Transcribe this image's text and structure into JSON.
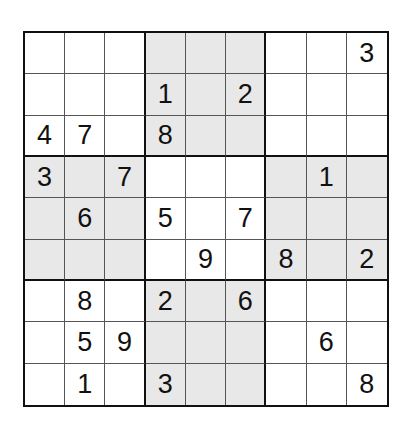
{
  "puzzle": {
    "type": "sudoku",
    "size": 9,
    "shade_color": "#e8e8e8",
    "shaded_boxes": [
      [
        0,
        1
      ],
      [
        1,
        0
      ],
      [
        1,
        2
      ],
      [
        2,
        1
      ]
    ],
    "grid": [
      [
        "",
        "",
        "",
        "",
        "",
        "",
        "",
        "",
        "3"
      ],
      [
        "",
        "",
        "",
        "1",
        "",
        "2",
        "",
        "",
        ""
      ],
      [
        "4",
        "7",
        "",
        "8",
        "",
        "",
        "",
        "",
        ""
      ],
      [
        "3",
        "",
        "7",
        "",
        "",
        "",
        "",
        "1",
        ""
      ],
      [
        "",
        "6",
        "",
        "5",
        "",
        "7",
        "",
        "",
        ""
      ],
      [
        "",
        "",
        "",
        "",
        "9",
        "",
        "8",
        "",
        "2"
      ],
      [
        "",
        "8",
        "",
        "2",
        "",
        "6",
        "",
        "",
        ""
      ],
      [
        "",
        "5",
        "9",
        "",
        "",
        "",
        "",
        "6",
        ""
      ],
      [
        "",
        "1",
        "",
        "3",
        "",
        "",
        "",
        "",
        "8"
      ]
    ]
  }
}
